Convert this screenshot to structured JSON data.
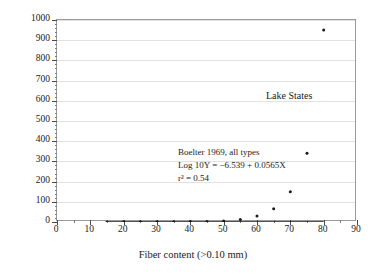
{
  "chart_data": {
    "type": "line",
    "title": "",
    "xlabel": "Fiber content (>0.10 mm)",
    "ylabel_parts": {
      "base": "K",
      "sub": "sat",
      "unit_pre": " (10",
      "unit_sup": "−5",
      "unit_mid": " cm s",
      "unit_sup2": "−1",
      "unit_post": ")"
    },
    "ylabel": "Ksat (10-5 cm s-1)",
    "xlim": [
      0,
      90
    ],
    "ylim": [
      0,
      1000
    ],
    "xticks": [
      0,
      10,
      20,
      30,
      40,
      50,
      60,
      70,
      80,
      90
    ],
    "yticks": [
      0,
      100,
      200,
      300,
      400,
      500,
      600,
      700,
      800,
      900,
      1000
    ],
    "x_minor_step": 5,
    "y_minor_step": 20,
    "grid": "horizontal",
    "legend_position": "inline-annotation",
    "series": [
      {
        "name": "Lake States",
        "color": "#1a1a1a",
        "marker": "dot",
        "x": [
          15,
          20,
          25,
          30,
          35,
          40,
          45,
          50,
          55,
          60,
          65,
          70,
          75,
          80
        ],
        "y": [
          0.5,
          0.7,
          0.9,
          1.2,
          1.6,
          2.1,
          2.8,
          5.5,
          12,
          30,
          65,
          150,
          340,
          950
        ]
      }
    ],
    "annotations": [
      {
        "name": "series-label",
        "text": "Lake States",
        "x": 68,
        "y": 640
      },
      {
        "name": "regression-line-1",
        "text": "Boelter 1969, all types"
      },
      {
        "name": "regression-line-2",
        "text": "Log 10Y = −6.539 + 0.0565X"
      },
      {
        "name": "regression-line-3",
        "text": "r² = 0.54"
      }
    ],
    "equation": {
      "intercept": -6.539,
      "slope": 0.0565,
      "r_squared": 0.54,
      "form": "log10(Y) = -6.539 + 0.0565*X"
    },
    "colors": {
      "curve": "#1a1a1a",
      "grid": "#e2e2e2",
      "frame": "#9a9a9a",
      "text": "#1a1a1a",
      "background": "#ffffff"
    }
  },
  "annotation_text": {
    "line1": "Boelter 1969, all types",
    "line2": "Log 10Y = −6.539 + 0.0565X",
    "line3": "r² = 0.54"
  },
  "series_label": "Lake States",
  "axis_titles": {
    "x": "Fiber content (>0.10 mm)"
  }
}
